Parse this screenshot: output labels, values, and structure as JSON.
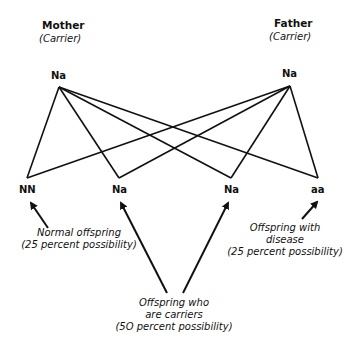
{
  "parents": {
    "mother": {
      "title": "Mother",
      "status": "(Carrier)",
      "genotype": "Na"
    },
    "father": {
      "title": "Father",
      "status": "(Carrier)",
      "genotype": "Na"
    }
  },
  "offspring": [
    {
      "genotype": "NN"
    },
    {
      "genotype": "Na"
    },
    {
      "genotype": "Na"
    },
    {
      "genotype": "aa"
    }
  ],
  "annotations": {
    "normal": {
      "line1": "Normal offspring",
      "line2": "(25 percent possibility)"
    },
    "disease": {
      "line1": "Offspring with",
      "line2": "disease",
      "line3": "(25 percent possibility)"
    },
    "carriers": {
      "line1": "Offspring who",
      "line2": "are carriers",
      "line3": "(5O percent possibility)"
    }
  },
  "colors": {
    "line": "#111111",
    "background": "#ffffff"
  }
}
